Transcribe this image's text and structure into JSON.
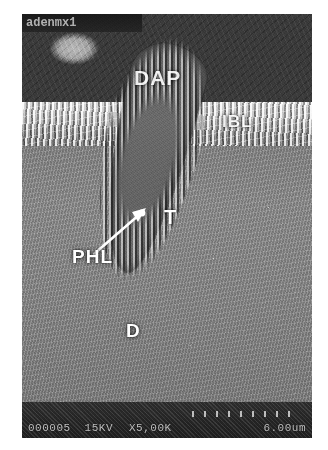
{
  "figure": {
    "kind": "sem-micrograph",
    "modality": "Scanning Electron Micrograph",
    "header_text": "adenmx1"
  },
  "annotations": [
    {
      "id": "dap",
      "label": "DAP",
      "meaning": "dentin adhesive / composite layer"
    },
    {
      "id": "ibl",
      "label": "IBL",
      "meaning": "interfacial bonding layer"
    },
    {
      "id": "t",
      "label": "T",
      "meaning": "dentinal tubule"
    },
    {
      "id": "phl",
      "label": "PHL",
      "meaning": "peritubular hybrid layer"
    },
    {
      "id": "d",
      "label": "D",
      "meaning": "dentin"
    }
  ],
  "labels": {
    "dap": "DAP",
    "ibl": "IBL",
    "t": "T",
    "phl": "PHL",
    "d": "D"
  },
  "databar": {
    "serial": "000005",
    "voltage": "15KV",
    "magnification": "X5,00K",
    "scale_length": "6.00um"
  },
  "colors": {
    "annotation": "#ffffff",
    "databar_background": "#1d1d1d",
    "databar_text": "#dcdcdc",
    "plate_background": "#8e8e8e",
    "page_background": "#ffffff"
  }
}
